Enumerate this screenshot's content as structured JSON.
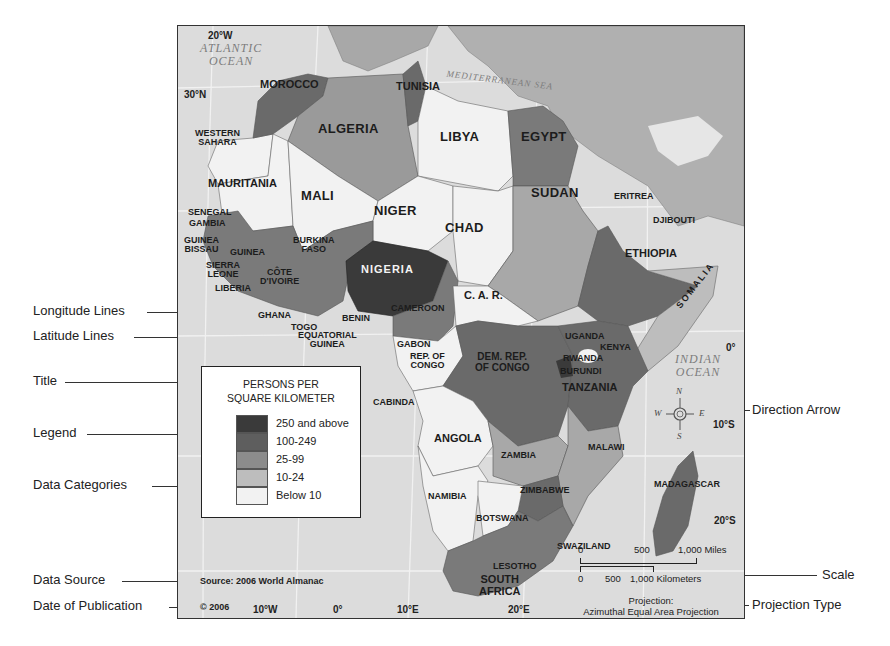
{
  "map": {
    "title": "PERSONS PER SQUARE KILOMETER",
    "title_line1": "PERSONS PER",
    "title_line2": "SQUARE KILOMETER",
    "source": "Source: 2006 World Almanac",
    "copyright": "© 2006",
    "projection_line1": "Projection:",
    "projection_line2": "Azimuthal Equal Area Projection"
  },
  "legend": {
    "categories": [
      {
        "label": "250 and above",
        "color": "#3a3a3a"
      },
      {
        "label": "100-249",
        "color": "#5e5e5e"
      },
      {
        "label": "25-99",
        "color": "#8c8c8c"
      },
      {
        "label": "10-24",
        "color": "#bdbdbd"
      },
      {
        "label": "Below 10",
        "color": "#f2f2f2"
      }
    ]
  },
  "callouts": {
    "longitude": "Longitude Lines",
    "latitude": "Latitude Lines",
    "title": "Title",
    "legend": "Legend",
    "data_categories": "Data Categories",
    "data_source": "Data Source",
    "date_of_publication": "Date of Publication",
    "direction_arrow": "Direction Arrow",
    "scale": "Scale",
    "projection_type": "Projection Type"
  },
  "oceans": {
    "atlantic_1": "ATLANTIC",
    "atlantic_2": "OCEAN",
    "mediterranean": "MEDITERRANEAN SEA",
    "indian_1": "INDIAN",
    "indian_2": "OCEAN"
  },
  "coords": {
    "lon_20w": "20°W",
    "lat_30n": "30°N",
    "lat_0": "0°",
    "lat_10s": "10°S",
    "lat_20s": "20°S",
    "lon_10w": "10°W",
    "lon_0": "0°",
    "lon_10e": "10°E",
    "lon_20e": "20°E"
  },
  "compass": {
    "n": "N",
    "s": "S",
    "e": "E",
    "w": "W"
  },
  "scale": {
    "miles_0": "0",
    "miles_500": "500",
    "miles_1000": "1,000 Miles",
    "km_0": "0",
    "km_500": "500",
    "km_1000": "1,000 Kilometers"
  },
  "countries": {
    "morocco": "MOROCCO",
    "tunisia": "TUNISIA",
    "algeria": "ALGERIA",
    "libya": "LIBYA",
    "egypt": "EGYPT",
    "western_sahara_1": "WESTERN",
    "western_sahara_2": "SAHARA",
    "mauritania": "MAURITANIA",
    "mali": "MALI",
    "niger": "NIGER",
    "chad": "CHAD",
    "sudan": "SUDAN",
    "eritrea": "ERITREA",
    "djibouti": "DJIBOUTI",
    "ethiopia": "ETHIOPIA",
    "somalia": "SOMALIA",
    "senegal": "SENEGAL",
    "gambia": "GAMBIA",
    "guinea_bissau_1": "GUINEA",
    "guinea_bissau_2": "BISSAU",
    "guinea": "GUINEA",
    "sierra_leone_1": "SIERRA",
    "sierra_leone_2": "LEONE",
    "liberia": "LIBERIA",
    "cote_divoire_1": "CÔTE",
    "cote_divoire_2": "D'IVOIRE",
    "burkina_faso_1": "BURKINA",
    "burkina_faso_2": "FASO",
    "ghana": "GHANA",
    "togo": "TOGO",
    "benin": "BENIN",
    "nigeria": "NIGERIA",
    "cameroon": "CAMEROON",
    "car": "C. A. R.",
    "eq_guinea_1": "EQUATORIAL",
    "eq_guinea_2": "GUINEA",
    "gabon": "GABON",
    "rep_congo_1": "REP. OF",
    "rep_congo_2": "CONGO",
    "drc_1": "DEM. REP.",
    "drc_2": "OF CONGO",
    "uganda": "UGANDA",
    "kenya": "KENYA",
    "rwanda": "RWANDA",
    "burundi": "BURUNDI",
    "tanzania": "TANZANIA",
    "cabinda": "CABINDA",
    "angola": "ANGOLA",
    "zambia": "ZAMBIA",
    "malawi": "MALAWI",
    "namibia": "NAMIBIA",
    "zimbabwe": "ZIMBABWE",
    "botswana": "BOTSWANA",
    "madagascar": "MADAGASCAR",
    "swaziland": "SWAZILAND",
    "lesotho": "LESOTHO",
    "south_africa_1": "SOUTH",
    "south_africa_2": "AFRICA"
  }
}
